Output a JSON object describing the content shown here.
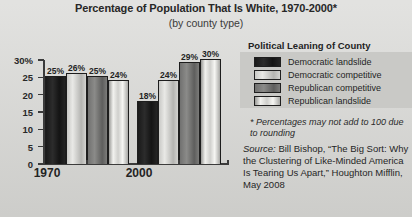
{
  "chart_data": {
    "type": "bar",
    "title": "Percentage of Population That Is White, 1970-2000*",
    "subtitle": "(by county type)",
    "xlabel": "",
    "ylabel": "",
    "categories": [
      "1970",
      "2000"
    ],
    "ylim": [
      0,
      30
    ],
    "grid": false,
    "legend_position": "right",
    "yticks": [
      {
        "value": 30,
        "label": "30%"
      },
      {
        "value": 25,
        "label": "25"
      },
      {
        "value": 20,
        "label": "20"
      },
      {
        "value": 15,
        "label": "15"
      },
      {
        "value": 10,
        "label": "10"
      },
      {
        "value": 5,
        "label": "5"
      },
      {
        "value": 0,
        "label": "0"
      }
    ],
    "series": [
      {
        "name": "Democratic landslide",
        "values": [
          25,
          18
        ],
        "labels": [
          "25%",
          "18%"
        ],
        "fill": "f0"
      },
      {
        "name": "Democratic competitive",
        "values": [
          26,
          24
        ],
        "labels": [
          "26%",
          "24%"
        ],
        "fill": "f1"
      },
      {
        "name": "Republican competitive",
        "values": [
          25,
          29
        ],
        "labels": [
          "25%",
          "29%"
        ],
        "fill": "f2"
      },
      {
        "name": "Republican landslide",
        "values": [
          24,
          30
        ],
        "labels": [
          "24%",
          "30%"
        ],
        "fill": "f3"
      }
    ]
  },
  "legend": {
    "title": "Political Leaning of County",
    "items": [
      {
        "label": "Democratic landslide"
      },
      {
        "label": "Democratic competitive"
      },
      {
        "label": "Republican competitive"
      },
      {
        "label": "Republican landslide"
      }
    ]
  },
  "notes": {
    "footnote": "* Percentages may not add to 100 due to rounding",
    "source_word": "Source:",
    "source_text": " Bill Bishop, “The Big Sort: Why the Clustering of Like-Minded America Is Tearing Us Apart,” Houghton Mifflin, May 2008"
  }
}
